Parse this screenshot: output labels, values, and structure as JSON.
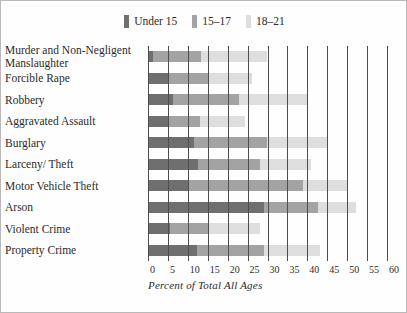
{
  "chart_data": {
    "type": "bar",
    "orientation": "horizontal",
    "stacked": true,
    "title": "",
    "xlabel": "Percent of Total All Ages",
    "ylabel": "",
    "xlim": [
      0,
      60
    ],
    "xticks": [
      0,
      5,
      10,
      15,
      20,
      25,
      30,
      35,
      40,
      45,
      50,
      55,
      60
    ],
    "xtick_labels": [
      "0",
      "5",
      "10",
      "15",
      "20",
      "25",
      "30",
      "35",
      "40",
      "45",
      "50",
      "55",
      "60"
    ],
    "grid": true,
    "grid_axis": "x",
    "legend_position": "top-center",
    "categories": [
      "Murder and Non-Negligent\nManslaughter",
      "Forcible Rape",
      "Robbery",
      "Aggravated Assault",
      "Burglary",
      "Larceny/ Theft",
      "Motor Vehicle Theft",
      "Arson",
      "Violent Crime",
      "Property Crime"
    ],
    "series": [
      {
        "name": "Under 15",
        "color": "#6f6f6f",
        "values": [
          1.2,
          5.2,
          6.3,
          5.0,
          11.5,
          12.6,
          10.3,
          29.0,
          5.4,
          12.3
        ]
      },
      {
        "name": "15–17",
        "color": "#a3a3a3",
        "values": [
          12.0,
          10.0,
          16.6,
          8.0,
          18.3,
          15.4,
          28.6,
          13.6,
          9.8,
          16.8
        ]
      },
      {
        "name": "18–21",
        "color": "#dedede",
        "values": [
          16.7,
          10.8,
          17.2,
          11.4,
          15.1,
          13.0,
          11.3,
          9.6,
          13.0,
          14.2
        ]
      }
    ]
  },
  "legend": {
    "entries": [
      {
        "label": "Under 15",
        "color": "#6f6f6f"
      },
      {
        "label": "15–17",
        "color": "#a3a3a3"
      },
      {
        "label": "18–21",
        "color": "#dedede"
      }
    ]
  },
  "axis": {
    "x_label": "Percent of Total All Ages"
  }
}
